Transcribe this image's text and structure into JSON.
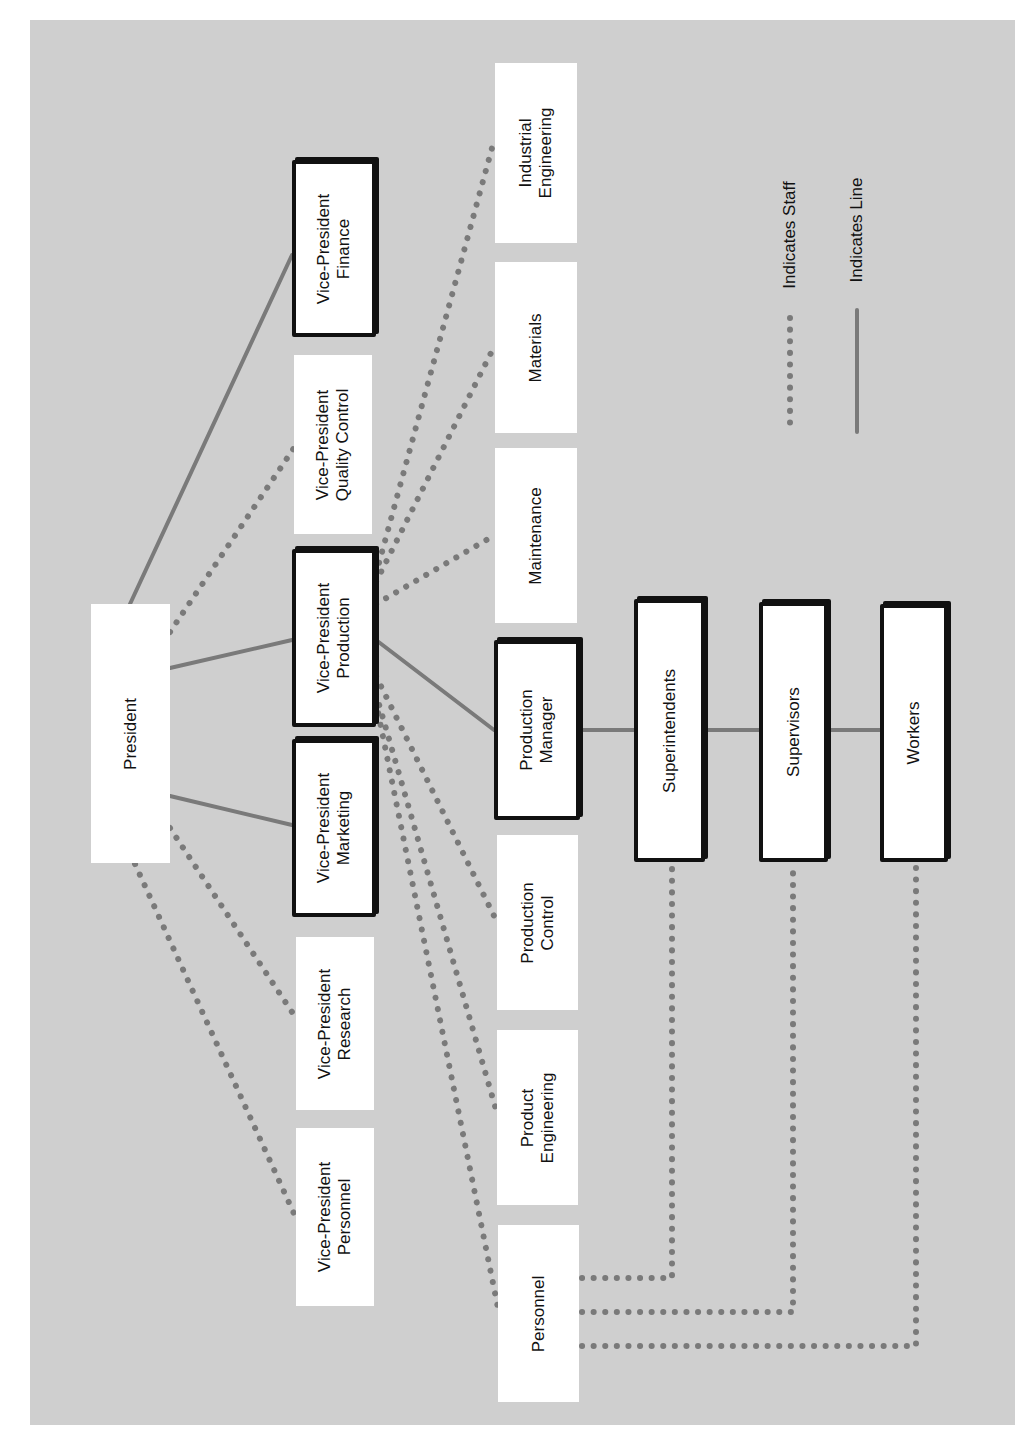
{
  "diagram": {
    "type": "organization-chart",
    "orientation": "rotated-90-ccw",
    "colors": {
      "background": "#cfcfcf",
      "box": "#ffffff",
      "border": "#111111",
      "connector": "#7a7a7a"
    },
    "nodes": {
      "president": "President",
      "vp_finance": "Vice-President\nFinance",
      "vp_quality_control": "Vice-President\nQuality Control",
      "vp_production": "Vice-President\nProduction",
      "vp_marketing": "Vice-President\nMarketing",
      "vp_research": "Vice-President\nResearch",
      "vp_personnel": "Vice-President\nPersonnel",
      "industrial_engineering": "Industrial\nEngineering",
      "materials": "Materials",
      "maintenance": "Maintenance",
      "production_manager": "Production\nManager",
      "production_control": "Production\nControl",
      "product_engineering": "Product\nEngineering",
      "personnel": "Personnel",
      "superintendents": "Superintendents",
      "supervisors": "Supervisors",
      "workers": "Workers"
    },
    "legend": {
      "staff": "Indicates Staff",
      "line": "Indicates Line"
    },
    "line_relationships": [
      [
        "President",
        "Vice-President Finance"
      ],
      [
        "President",
        "Vice-President Production"
      ],
      [
        "President",
        "Vice-President Marketing"
      ],
      [
        "Vice-President Production",
        "Production Manager"
      ],
      [
        "Production Manager",
        "Superintendents"
      ],
      [
        "Superintendents",
        "Supervisors"
      ],
      [
        "Supervisors",
        "Workers"
      ]
    ],
    "staff_relationships": [
      [
        "President",
        "Vice-President Quality Control"
      ],
      [
        "President",
        "Vice-President Research"
      ],
      [
        "President",
        "Vice-President Personnel"
      ],
      [
        "Vice-President Production",
        "Industrial Engineering"
      ],
      [
        "Vice-President Production",
        "Materials"
      ],
      [
        "Vice-President Production",
        "Maintenance"
      ],
      [
        "Vice-President Production",
        "Production Control"
      ],
      [
        "Vice-President Production",
        "Product Engineering"
      ],
      [
        "Vice-President Production",
        "Personnel"
      ],
      [
        "Personnel",
        "Superintendents"
      ],
      [
        "Personnel",
        "Supervisors"
      ],
      [
        "Personnel",
        "Workers"
      ]
    ]
  }
}
